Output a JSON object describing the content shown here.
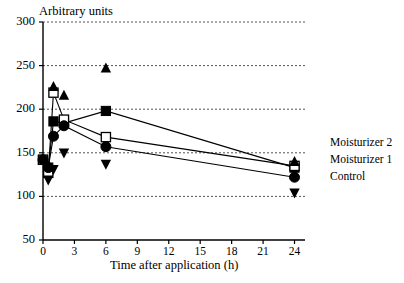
{
  "chart_data": {
    "type": "line",
    "title": "",
    "xlabel": "Time after application (h)",
    "ylabel": "Arbitrary units",
    "xlim": [
      0,
      25
    ],
    "ylim": [
      50,
      300
    ],
    "xticks": [
      "0",
      "3",
      "6",
      "9",
      "12",
      "15",
      "18",
      "21",
      "24"
    ],
    "xtick_values": [
      0,
      3,
      6,
      9,
      12,
      15,
      18,
      21,
      24
    ],
    "yticks": [
      "50",
      "100",
      "150",
      "200",
      "250",
      "300"
    ],
    "ytick_values": [
      50,
      100,
      150,
      200,
      250,
      300
    ],
    "grid": "horizontal dotted gridlines at 100, 150, 200, 250, 300",
    "legend_position": "right, outside plot area",
    "x": [
      0,
      0.5,
      1,
      2,
      6,
      24
    ],
    "series": [
      {
        "name": "Moisturizer 2",
        "marker": "filled-square",
        "connected": true,
        "values": [
          142,
          133,
          186,
          184,
          198,
          133
        ]
      },
      {
        "name": "Moisturizer 1",
        "marker": "open-square",
        "connected": true,
        "values": [
          142,
          127,
          219,
          188,
          168,
          135
        ]
      },
      {
        "name": "Control",
        "marker": "filled-circle",
        "connected": true,
        "values": [
          142,
          133,
          169,
          181,
          157,
          122
        ]
      },
      {
        "name": "upper-error-bound",
        "marker": "filled-up-triangle",
        "connected": false,
        "values": [
          null,
          null,
          226,
          216,
          247,
          140
        ]
      },
      {
        "name": "lower-error-bound",
        "marker": "filled-down-triangle",
        "connected": false,
        "values": [
          null,
          119,
          131,
          150,
          137,
          104
        ]
      }
    ]
  },
  "legend": {
    "entries": [
      {
        "label": "Moisturizer 2"
      },
      {
        "label": "Moisturizer 1"
      },
      {
        "label": "Control"
      }
    ]
  },
  "axes": {
    "y_title": "Arbitrary units",
    "x_title": "Time after application (h)"
  }
}
